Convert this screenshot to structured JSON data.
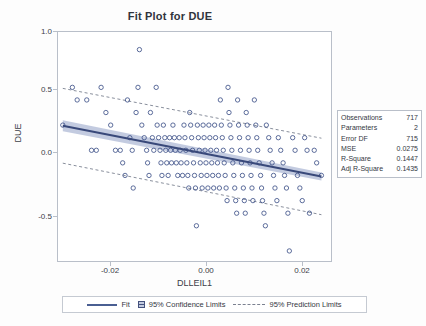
{
  "chart": {
    "title": "Fit Plot for DUE",
    "xlabel": "DLLEIL1",
    "ylabel": "DUE"
  },
  "axes": {
    "y_ticks": [
      "1.0",
      "0.5",
      "0.0",
      "-0.5"
    ],
    "x_ticks": [
      "-0.02",
      "0.00",
      "0.02"
    ]
  },
  "stats": {
    "rows": [
      {
        "key": "Observations",
        "value": "717"
      },
      {
        "key": "Parameters",
        "value": "2"
      },
      {
        "key": "Error DF",
        "value": "715"
      },
      {
        "key": "MSE",
        "value": "0.0275"
      },
      {
        "key": "R-Square",
        "value": "0.1447"
      },
      {
        "key": "Adj R-Square",
        "value": "0.1435"
      }
    ]
  },
  "legend": {
    "fit": "Fit",
    "confidence": "95% Confidence Limits",
    "prediction": "95% Prediction Limits"
  },
  "colors": {
    "fit_line": "#39497a",
    "confidence_band": "#b9c2da",
    "prediction_line": "#7b8190",
    "marker_stroke": "#3f5289",
    "frame": "#b9bfc9",
    "text": "#34383f"
  },
  "chart_data": {
    "type": "scatter",
    "title": "Fit Plot for DUE",
    "xlabel": "DLLEIL1",
    "ylabel": "DUE",
    "xlim": [
      -0.0335,
      0.0235
    ],
    "ylim": [
      -0.78,
      1.04
    ],
    "xticks": [
      -0.02,
      0.0,
      0.02
    ],
    "yticks": [
      -0.5,
      0.0,
      0.5,
      1.0
    ],
    "grid": false,
    "legend_position": "bottom",
    "n_observations": 717,
    "regression": {
      "intercept": 0.0525,
      "slope": -7.45,
      "r_square": 0.1447,
      "adj_r_square": 0.1435,
      "mse": 0.0275,
      "parameters": 2,
      "error_df": 715,
      "fit_endpoints": [
        {
          "x": -0.0325,
          "y": 0.295
        },
        {
          "x": 0.0215,
          "y": -0.108
        }
      ]
    },
    "confidence_limits": {
      "label": "95% Confidence Limits",
      "lower_endpoints": [
        {
          "x": -0.0325,
          "y": 0.252
        },
        {
          "x": 0.0215,
          "y": -0.14
        }
      ],
      "upper_endpoints": [
        {
          "x": -0.0325,
          "y": 0.338
        },
        {
          "x": 0.0215,
          "y": -0.076
        }
      ]
    },
    "prediction_limits": {
      "label": "95% Prediction Limits",
      "lower_endpoints": [
        {
          "x": -0.0325,
          "y": -0.0025
        },
        {
          "x": 0.0215,
          "y": -0.412
        }
      ],
      "upper_endpoints": [
        {
          "x": -0.0325,
          "y": 0.592
        },
        {
          "x": 0.0215,
          "y": 0.196
        }
      ]
    },
    "series": [
      {
        "name": "DUE observations",
        "note": "Response values are quantised to 0.1 increments, producing dense horizontal bands.",
        "points": [
          [
            -0.0325,
            0.3
          ],
          [
            -0.0305,
            0.6
          ],
          [
            -0.0295,
            0.5
          ],
          [
            -0.0275,
            0.5
          ],
          [
            -0.0265,
            0.1
          ],
          [
            -0.0255,
            0.1
          ],
          [
            -0.0245,
            0.6
          ],
          [
            -0.0235,
            0.4
          ],
          [
            -0.0225,
            0.3
          ],
          [
            -0.0215,
            0.1
          ],
          [
            -0.0205,
            0.1
          ],
          [
            -0.02,
            0.0
          ],
          [
            -0.0195,
            -0.1
          ],
          [
            -0.019,
            0.5
          ],
          [
            -0.0185,
            0.2
          ],
          [
            -0.018,
            0.1
          ],
          [
            -0.0178,
            -0.2
          ],
          [
            -0.0172,
            0.4
          ],
          [
            -0.0168,
            0.6
          ],
          [
            -0.0165,
            0.9
          ],
          [
            -0.016,
            0.3
          ],
          [
            -0.0155,
            0.2
          ],
          [
            -0.015,
            0.1
          ],
          [
            -0.0148,
            0.0
          ],
          [
            -0.0145,
            -0.1
          ],
          [
            -0.0142,
            0.4
          ],
          [
            -0.0138,
            0.2
          ],
          [
            -0.0135,
            0.1
          ],
          [
            -0.013,
            0.6
          ],
          [
            -0.0128,
            0.3
          ],
          [
            -0.0125,
            0.2
          ],
          [
            -0.0122,
            0.1
          ],
          [
            -0.012,
            0.0
          ],
          [
            -0.0118,
            -0.1
          ],
          [
            -0.0115,
            0.3
          ],
          [
            -0.0112,
            0.2
          ],
          [
            -0.011,
            0.1
          ],
          [
            -0.0108,
            0.0
          ],
          [
            -0.0105,
            -0.1
          ],
          [
            -0.0102,
            0.2
          ],
          [
            -0.01,
            0.1
          ],
          [
            -0.0098,
            0.0
          ],
          [
            -0.0095,
            0.3
          ],
          [
            -0.0092,
            0.2
          ],
          [
            -0.009,
            0.1
          ],
          [
            -0.0088,
            0.0
          ],
          [
            -0.0085,
            -0.1
          ],
          [
            -0.0082,
            0.2
          ],
          [
            -0.008,
            0.1
          ],
          [
            -0.0078,
            0.0
          ],
          [
            -0.0075,
            -0.1
          ],
          [
            -0.0072,
            0.3
          ],
          [
            -0.007,
            0.2
          ],
          [
            -0.0068,
            0.1
          ],
          [
            -0.0066,
            0.0
          ],
          [
            -0.0064,
            -0.1
          ],
          [
            -0.0062,
            -0.2
          ],
          [
            -0.006,
            0.4
          ],
          [
            -0.0058,
            0.3
          ],
          [
            -0.0056,
            0.2
          ],
          [
            -0.0054,
            0.1
          ],
          [
            -0.0052,
            0.0
          ],
          [
            -0.005,
            -0.1
          ],
          [
            -0.0048,
            -0.2
          ],
          [
            -0.0046,
            -0.5
          ],
          [
            -0.0044,
            0.3
          ],
          [
            -0.0042,
            0.2
          ],
          [
            -0.004,
            0.1
          ],
          [
            -0.0038,
            0.0
          ],
          [
            -0.0036,
            -0.1
          ],
          [
            -0.0034,
            -0.2
          ],
          [
            -0.0032,
            0.3
          ],
          [
            -0.003,
            0.2
          ],
          [
            -0.0028,
            0.1
          ],
          [
            -0.0026,
            0.0
          ],
          [
            -0.0024,
            -0.1
          ],
          [
            -0.0022,
            -0.2
          ],
          [
            -0.002,
            0.3
          ],
          [
            -0.0018,
            0.2
          ],
          [
            -0.0016,
            0.1
          ],
          [
            -0.0014,
            0.0
          ],
          [
            -0.0012,
            -0.1
          ],
          [
            -0.001,
            -0.2
          ],
          [
            -0.0008,
            0.3
          ],
          [
            -0.0006,
            0.2
          ],
          [
            -0.0004,
            0.1
          ],
          [
            -0.0002,
            0.0
          ],
          [
            0.0,
            -0.1
          ],
          [
            0.0002,
            -0.2
          ],
          [
            0.0004,
            0.5
          ],
          [
            0.0006,
            0.3
          ],
          [
            0.0008,
            0.2
          ],
          [
            0.001,
            0.1
          ],
          [
            0.0012,
            0.0
          ],
          [
            0.0014,
            -0.1
          ],
          [
            0.0016,
            -0.2
          ],
          [
            0.0018,
            -0.3
          ],
          [
            0.002,
            0.6
          ],
          [
            0.0022,
            0.4
          ],
          [
            0.0024,
            0.3
          ],
          [
            0.0026,
            0.2
          ],
          [
            0.0028,
            0.1
          ],
          [
            0.003,
            0.0
          ],
          [
            0.0032,
            -0.1
          ],
          [
            0.0034,
            -0.2
          ],
          [
            0.0036,
            -0.3
          ],
          [
            0.0038,
            -0.4
          ],
          [
            0.004,
            0.5
          ],
          [
            0.0042,
            0.3
          ],
          [
            0.0044,
            0.2
          ],
          [
            0.0046,
            0.1
          ],
          [
            0.0048,
            0.0
          ],
          [
            0.005,
            -0.1
          ],
          [
            0.0052,
            -0.2
          ],
          [
            0.0054,
            -0.3
          ],
          [
            0.0056,
            -0.4
          ],
          [
            0.0058,
            0.4
          ],
          [
            0.006,
            0.3
          ],
          [
            0.0062,
            0.2
          ],
          [
            0.0064,
            0.1
          ],
          [
            0.0066,
            0.0
          ],
          [
            0.0068,
            -0.1
          ],
          [
            0.007,
            -0.2
          ],
          [
            0.0072,
            -0.3
          ],
          [
            0.0075,
            0.5
          ],
          [
            0.0078,
            0.3
          ],
          [
            0.008,
            0.2
          ],
          [
            0.0082,
            0.1
          ],
          [
            0.0085,
            0.0
          ],
          [
            0.0088,
            -0.1
          ],
          [
            0.009,
            -0.2
          ],
          [
            0.0092,
            -0.3
          ],
          [
            0.0095,
            -0.4
          ],
          [
            0.0098,
            -0.5
          ],
          [
            0.01,
            0.3
          ],
          [
            0.0105,
            0.2
          ],
          [
            0.0108,
            0.1
          ],
          [
            0.0112,
            0.0
          ],
          [
            0.0115,
            -0.1
          ],
          [
            0.0118,
            -0.2
          ],
          [
            0.0122,
            -0.3
          ],
          [
            0.0125,
            0.2
          ],
          [
            0.013,
            0.1
          ],
          [
            0.0135,
            0.0
          ],
          [
            0.0138,
            -0.1
          ],
          [
            0.0142,
            -0.2
          ],
          [
            0.0145,
            -0.4
          ],
          [
            0.0148,
            -0.7
          ],
          [
            0.0155,
            0.2
          ],
          [
            0.016,
            0.1
          ],
          [
            0.0165,
            -0.1
          ],
          [
            0.017,
            -0.2
          ],
          [
            0.0175,
            -0.3
          ],
          [
            0.018,
            0.2
          ],
          [
            0.0185,
            0.1
          ],
          [
            0.019,
            -0.4
          ],
          [
            0.02,
            0.1
          ],
          [
            0.0205,
            0.0
          ],
          [
            0.0215,
            -0.1
          ]
        ]
      }
    ]
  }
}
